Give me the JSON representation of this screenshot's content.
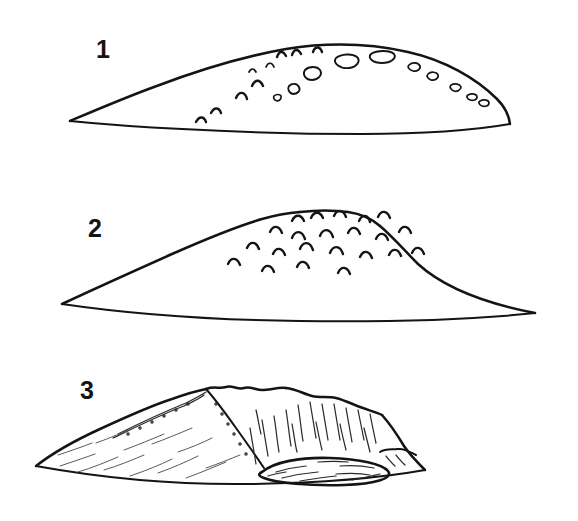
{
  "figure": {
    "background_color": "#ffffff",
    "ink_color": "#141414",
    "style": "black-and-white line drawing",
    "panel_count": 3,
    "panels": [
      {
        "label": "1",
        "name": "low-shield-profile",
        "description": "Very low, broad lens-shaped mound with gently convex summit and pointed lateral tips; summit dotted with small oval vent outlines and tiny chevron marks.",
        "label_position": {
          "x": 96,
          "y": 58
        },
        "marking_type": "small oval craters and chevrons",
        "marking_count": 19
      },
      {
        "label": "2",
        "name": "steep-cone-profile",
        "description": "Taller, steeper cone with rounded flattish summit and straight flanks meeting pointed lateral tips; summit and upper flanks covered with chevron vent marks.",
        "label_position": {
          "x": 88,
          "y": 237
        },
        "marking_type": "chevron vent marks",
        "marking_count": 22
      },
      {
        "label": "3",
        "name": "collapsed-caldera-profile",
        "description": "Eroded, asymmetric edifice with a breached summit, steep hachured collapse scarp on the right and an elliptical caldera floor at the base.",
        "label_position": {
          "x": 80,
          "y": 399
        },
        "marking_type": "hachured scarp and elliptical caldera floor",
        "marking_count": 0
      }
    ]
  },
  "panel_labels": {
    "one": "1",
    "two": "2",
    "three": "3"
  }
}
